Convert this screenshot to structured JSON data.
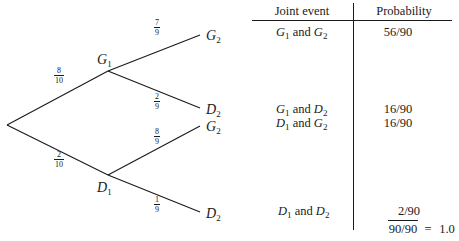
{
  "tree": {
    "root": {
      "x": 7,
      "y": 125
    },
    "nodes": [
      {
        "id": "G1",
        "letter": "G",
        "sub": "1",
        "x": 108,
        "y": 71,
        "label_x": 97,
        "label_y": 64
      },
      {
        "id": "D1",
        "letter": "D",
        "sub": "1",
        "x": 108,
        "y": 175,
        "label_x": 97,
        "label_y": 192
      }
    ],
    "leaves": [
      {
        "id": "G2-top",
        "letter": "G",
        "sub": "2",
        "x": 200,
        "y": 35,
        "label_x": 206,
        "label_y": 40
      },
      {
        "id": "D2-upper",
        "letter": "D",
        "sub": "2",
        "x": 200,
        "y": 108,
        "label_x": 206,
        "label_y": 114
      },
      {
        "id": "G2-lower",
        "letter": "G",
        "sub": "2",
        "x": 200,
        "y": 126,
        "label_x": 206,
        "label_y": 131
      },
      {
        "id": "D2-bottom",
        "letter": "D",
        "sub": "2",
        "x": 200,
        "y": 212,
        "label_x": 206,
        "label_y": 218
      }
    ],
    "branches": [
      {
        "from": "root",
        "to": "G1",
        "num": "8",
        "den": "10",
        "label_x": 59,
        "label_y": 77
      },
      {
        "from": "root",
        "to": "D1",
        "num": "2",
        "den": "10",
        "label_x": 59,
        "label_y": 160
      },
      {
        "from": "G1",
        "to": "G2-top",
        "num": "7",
        "den": "9",
        "label_x": 157,
        "label_y": 30
      },
      {
        "from": "G1",
        "to": "D2-upper",
        "num": "2",
        "den": "9",
        "label_x": 157,
        "label_y": 98
      },
      {
        "from": "D1",
        "to": "G2-lower",
        "num": "8",
        "den": "9",
        "label_x": 157,
        "label_y": 130
      },
      {
        "from": "D1",
        "to": "D2-bottom",
        "num": "1",
        "den": "9",
        "label_x": 157,
        "label_y": 203
      }
    ]
  },
  "table": {
    "headers": {
      "joint_event": "Joint event",
      "probability": "Probability"
    },
    "rows": [
      {
        "e1": "G",
        "s1": "1",
        "conj": " and ",
        "e2": "G",
        "s2": "2",
        "probability": "56/90",
        "y": 36
      },
      {
        "e1": "G",
        "s1": "1",
        "conj": " and ",
        "e2": "D",
        "s2": "2",
        "probability": "16/90",
        "y": 113
      },
      {
        "e1": "D",
        "s1": "1",
        "conj": " and ",
        "e2": "G",
        "s2": "2",
        "probability": "16/90",
        "y": 127
      },
      {
        "e1": "D",
        "s1": "1",
        "conj": " and ",
        "e2": "D",
        "s2": "2",
        "probability": "2/90",
        "y": 215
      }
    ],
    "total": {
      "value": "90/90",
      "equals": "=",
      "result": "1.0"
    }
  }
}
